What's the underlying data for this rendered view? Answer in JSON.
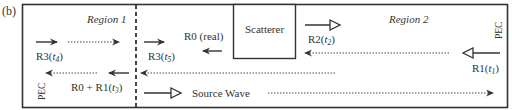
{
  "panel_label": "(b)",
  "regions": {
    "left": "Region 1",
    "right": "Region 2"
  },
  "walls": {
    "left": "PEC",
    "right": "PEC"
  },
  "scatterer": {
    "label": "Scatterer"
  },
  "labels": {
    "r3_t4": {
      "main": "R3(",
      "var": "t",
      "sub": "4",
      "close": ")"
    },
    "r3_t5": {
      "main": "R3(",
      "var": "t",
      "sub": "5",
      "close": ")"
    },
    "r0_real": "R0 (real)",
    "r2_t2": {
      "main": "R2(",
      "var": "t",
      "sub": "2",
      "close": ")"
    },
    "r1_t1": {
      "main": "R1(",
      "var": "t",
      "sub": "1",
      "close": ")"
    },
    "r0_r1_t3": {
      "main": "R0 + R1(",
      "var": "t",
      "sub": "3",
      "close": ")"
    },
    "source_wave": "Source Wave"
  },
  "colors": {
    "stroke": "#333333",
    "background": "#ffffff"
  }
}
